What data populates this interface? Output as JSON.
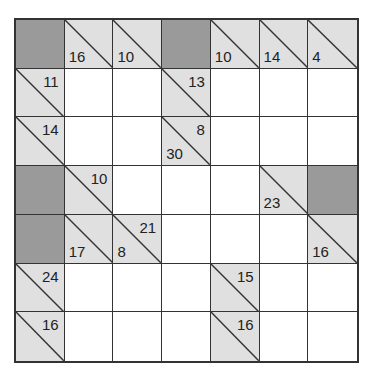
{
  "puzzle": {
    "type": "kakuro",
    "rows": 7,
    "cols": 7,
    "colors": {
      "block": "#9a9a9a",
      "clue": "#e0e0e0",
      "empty": "#ffffff",
      "line": "#333333"
    },
    "cells": [
      [
        {
          "t": "block"
        },
        {
          "t": "clue",
          "down": "16"
        },
        {
          "t": "clue",
          "down": "10"
        },
        {
          "t": "block"
        },
        {
          "t": "clue",
          "down": "10"
        },
        {
          "t": "clue",
          "down": "14"
        },
        {
          "t": "clue",
          "down": "4"
        }
      ],
      [
        {
          "t": "clue",
          "across": "11"
        },
        {
          "t": "empty"
        },
        {
          "t": "empty"
        },
        {
          "t": "clue",
          "across": "13"
        },
        {
          "t": "empty"
        },
        {
          "t": "empty"
        },
        {
          "t": "empty"
        }
      ],
      [
        {
          "t": "clue",
          "across": "14"
        },
        {
          "t": "empty"
        },
        {
          "t": "empty"
        },
        {
          "t": "clue",
          "down": "30",
          "across": "8"
        },
        {
          "t": "empty"
        },
        {
          "t": "empty"
        },
        {
          "t": "empty"
        }
      ],
      [
        {
          "t": "block"
        },
        {
          "t": "clue",
          "across": "10"
        },
        {
          "t": "empty"
        },
        {
          "t": "empty"
        },
        {
          "t": "empty"
        },
        {
          "t": "clue",
          "down": "23"
        },
        {
          "t": "block"
        }
      ],
      [
        {
          "t": "block"
        },
        {
          "t": "clue",
          "down": "17"
        },
        {
          "t": "clue",
          "down": "8",
          "across": "21"
        },
        {
          "t": "empty"
        },
        {
          "t": "empty"
        },
        {
          "t": "empty"
        },
        {
          "t": "clue",
          "down": "16"
        }
      ],
      [
        {
          "t": "clue",
          "across": "24"
        },
        {
          "t": "empty"
        },
        {
          "t": "empty"
        },
        {
          "t": "empty"
        },
        {
          "t": "clue",
          "across": "15"
        },
        {
          "t": "empty"
        },
        {
          "t": "empty"
        }
      ],
      [
        {
          "t": "clue",
          "across": "16"
        },
        {
          "t": "empty"
        },
        {
          "t": "empty"
        },
        {
          "t": "empty"
        },
        {
          "t": "clue",
          "across": "16"
        },
        {
          "t": "empty"
        },
        {
          "t": "empty"
        }
      ]
    ]
  }
}
